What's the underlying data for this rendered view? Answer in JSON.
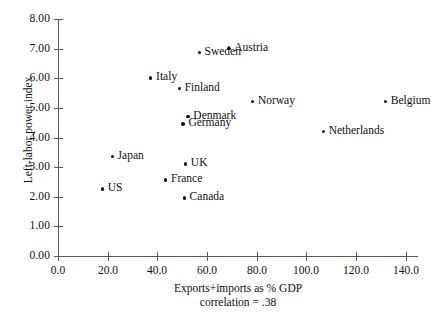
{
  "chart_data": {
    "type": "scatter",
    "title": "",
    "xlabel": "Exports+imports as % GDP",
    "ylabel": "Left-labor power index",
    "annotation": "correlation = .38",
    "xlim": [
      0.0,
      145.0
    ],
    "ylim": [
      0.0,
      8.0
    ],
    "grid": false,
    "legend": "none",
    "xticks": [
      "0.0",
      "20.0",
      "40.0",
      "60.0",
      "80.0",
      "100.0",
      "120.0",
      "140.0"
    ],
    "xtick_values": [
      0,
      20,
      40,
      60,
      80,
      100,
      120,
      140
    ],
    "yticks": [
      "0.00",
      "1.00",
      "2.00",
      "3.00",
      "4.00",
      "5.00",
      "6.00",
      "7.00",
      "8.00"
    ],
    "ytick_values": [
      0,
      1,
      2,
      3,
      4,
      5,
      6,
      7,
      8
    ],
    "points": [
      {
        "label": "Austria",
        "x": 69.0,
        "y": 7.0
      },
      {
        "label": "Sweden",
        "x": 57.0,
        "y": 6.85
      },
      {
        "label": "Italy",
        "x": 37.5,
        "y": 6.0
      },
      {
        "label": "Finland",
        "x": 49.0,
        "y": 5.65
      },
      {
        "label": "Norway",
        "x": 78.5,
        "y": 5.2
      },
      {
        "label": "Belgium",
        "x": 132.0,
        "y": 5.2
      },
      {
        "label": "Denmark",
        "x": 52.5,
        "y": 4.7
      },
      {
        "label": "Germany",
        "x": 50.5,
        "y": 4.45
      },
      {
        "label": "Netherlands",
        "x": 107.0,
        "y": 4.2
      },
      {
        "label": "Japan",
        "x": 22.0,
        "y": 3.35
      },
      {
        "label": "UK",
        "x": 51.5,
        "y": 3.1
      },
      {
        "label": "France",
        "x": 43.5,
        "y": 2.55
      },
      {
        "label": "US",
        "x": 18.0,
        "y": 2.25
      },
      {
        "label": "Canada",
        "x": 51.0,
        "y": 1.95
      }
    ]
  },
  "colors": {
    "marker": "#111111",
    "axis": "#595959",
    "text": "#101010",
    "background": "#ffffff"
  }
}
